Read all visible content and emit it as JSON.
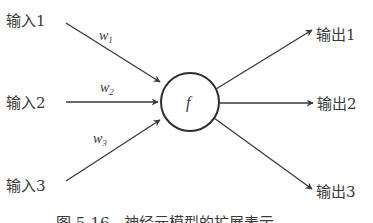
{
  "diagram": {
    "type": "neuron-model",
    "node": {
      "label": "f"
    },
    "inputs": [
      {
        "label": "输入1",
        "weight": "w",
        "weight_sub": "1"
      },
      {
        "label": "输入2",
        "weight": "w",
        "weight_sub": "2"
      },
      {
        "label": "输入3",
        "weight": "w",
        "weight_sub": "3"
      }
    ],
    "outputs": [
      {
        "label": "输出1"
      },
      {
        "label": "输出2"
      },
      {
        "label": "输出3"
      }
    ],
    "caption": "图 5-16　神经元模型的扩展表示",
    "colors": {
      "stroke": "#3a3a3a",
      "background": "#ffffff"
    }
  }
}
